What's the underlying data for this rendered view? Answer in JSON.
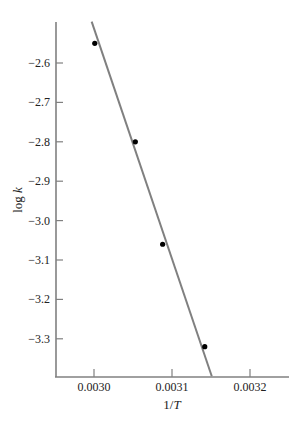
{
  "chart_data": {
    "type": "scatter",
    "title": "",
    "xlabel": "1/T",
    "ylabel": "log k",
    "xlim": [
      0.00294,
      0.003245
    ],
    "ylim": [
      -3.395,
      -2.5
    ],
    "x_ticks": [
      0.003,
      0.0031,
      0.0032
    ],
    "x_tick_labels": [
      "0.0030",
      "0.0031",
      "0.0032"
    ],
    "y_ticks": [
      -2.6,
      -2.7,
      -2.8,
      -2.9,
      -3.0,
      -3.1,
      -3.2,
      -3.3
    ],
    "y_tick_labels": [
      "−2.6",
      "−2.7",
      "−2.8",
      "−2.9",
      "−3.0",
      "−3.1",
      "−3.2",
      "−3.3"
    ],
    "grid": false,
    "legend": null,
    "series": [
      {
        "name": "data",
        "type": "scatter",
        "x": [
          0.003001,
          0.003053,
          0.003088,
          0.003142
        ],
        "y": [
          -2.55,
          -2.8,
          -3.06,
          -3.32
        ],
        "color": "#000000"
      },
      {
        "name": "fit",
        "type": "line",
        "x": [
          0.002997,
          0.003151
        ],
        "y": [
          -2.495,
          -3.395
        ],
        "color": "#808080"
      }
    ]
  },
  "colors": {
    "axis": "#808080",
    "line": "#808080",
    "point": "#000000",
    "text": "#222222"
  }
}
